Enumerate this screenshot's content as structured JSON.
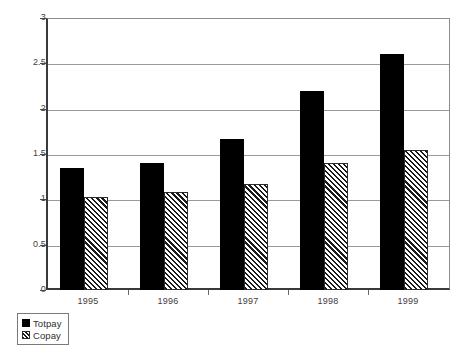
{
  "chart_data": {
    "type": "bar",
    "title": "",
    "subtitle": "",
    "xlabel": "",
    "ylabel": "",
    "categories": [
      "1995",
      "1996",
      "1997",
      "1998",
      "1999"
    ],
    "series": [
      {
        "name": "Totpay",
        "values": [
          1.35,
          1.4,
          1.67,
          2.2,
          2.6
        ],
        "color": "#000000",
        "fill": "solid"
      },
      {
        "name": "Copay",
        "values": [
          1.03,
          1.08,
          1.17,
          1.4,
          1.54
        ],
        "color": "#1a1a1a",
        "fill": "diagonal-hatch"
      }
    ],
    "ylim": [
      0,
      3
    ],
    "ytick_labels": [
      "3",
      "2.5",
      "2",
      "1.5",
      "1",
      "0.5",
      "0"
    ],
    "ytick_values": [
      3,
      2.5,
      2,
      1.5,
      1,
      0.5,
      0
    ],
    "grid": true,
    "legend": {
      "position": "bottom-left",
      "entries": [
        {
          "label": "Totpay",
          "fill": "solid"
        },
        {
          "label": "Copay",
          "fill": "diagonal-hatch"
        }
      ]
    }
  }
}
